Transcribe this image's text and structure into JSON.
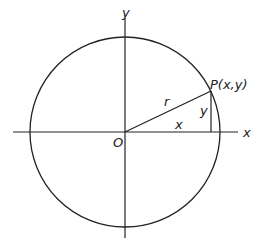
{
  "diagram": {
    "labels": {
      "y_axis": "y",
      "x_axis": "x",
      "origin": "O",
      "point": "P(x,y)",
      "radius": "r",
      "horizontal_leg": "x",
      "vertical_leg": "y"
    },
    "colors": {
      "stroke": "#222222",
      "background": "#ffffff"
    }
  }
}
